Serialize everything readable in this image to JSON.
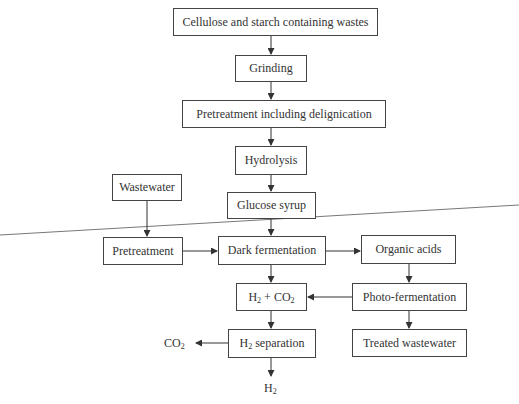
{
  "diagram": {
    "type": "flowchart",
    "title": "",
    "nodes": {
      "cellulose_wastes": "Cellulose and starch containing wastes",
      "grinding": "Grinding",
      "pretreatment_delignication": "Pretreatment including delignication",
      "hydrolysis": "Hydrolysis",
      "wastewater": "Wastewater",
      "glucose_syrup": "Glucose syrup",
      "pretreatment": "Pretreatment",
      "dark_fermentation": "Dark fermentation",
      "organic_acids": "Organic acids",
      "h2_co2": {
        "a": "H",
        "a_sub": "2",
        "plus": " + CO",
        "b_sub": "2"
      },
      "photo_fermentation": "Photo-fermentation",
      "h2_separation": {
        "a": "H",
        "a_sub": "2",
        "rest": " separation"
      },
      "treated_wastewater": "Treated wastewater",
      "co2_out": {
        "a": "CO",
        "a_sub": "2"
      },
      "h2_out": {
        "a": "H",
        "a_sub": "2"
      }
    },
    "edges": [
      [
        "cellulose_wastes",
        "grinding"
      ],
      [
        "grinding",
        "pretreatment_delignication"
      ],
      [
        "pretreatment_delignication",
        "hydrolysis"
      ],
      [
        "hydrolysis",
        "glucose_syrup"
      ],
      [
        "glucose_syrup",
        "dark_fermentation"
      ],
      [
        "wastewater",
        "pretreatment"
      ],
      [
        "pretreatment",
        "dark_fermentation"
      ],
      [
        "dark_fermentation",
        "organic_acids"
      ],
      [
        "dark_fermentation",
        "h2_co2"
      ],
      [
        "organic_acids",
        "photo_fermentation"
      ],
      [
        "photo_fermentation",
        "h2_co2"
      ],
      [
        "photo_fermentation",
        "treated_wastewater"
      ],
      [
        "h2_co2",
        "h2_separation"
      ],
      [
        "h2_separation",
        "co2_out"
      ],
      [
        "h2_separation",
        "h2_out"
      ]
    ],
    "colors": {
      "line": "#444444",
      "text": "#333333",
      "divider": "#777777"
    }
  }
}
